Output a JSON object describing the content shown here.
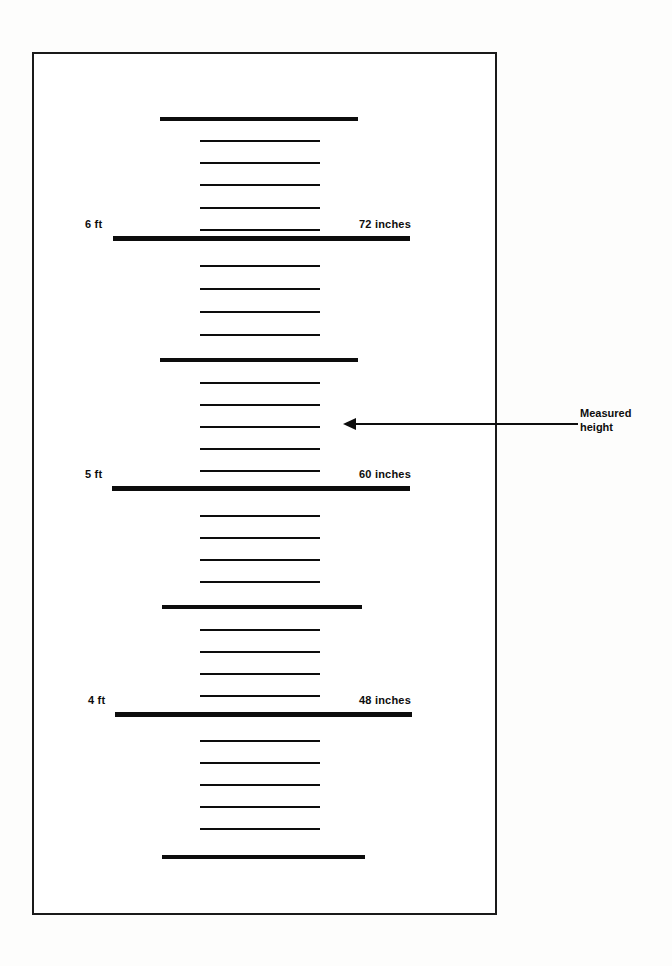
{
  "figure": {
    "background_color": "#fdfdfc",
    "ink_color": "#0d0d0d"
  },
  "chart_data": {
    "type": "table",
    "orientation": "vertical",
    "unit_major": "feet",
    "unit_minor": "inches",
    "axis_range_inches": [
      42,
      78
    ],
    "grid": false,
    "legend": false,
    "labeled_marks": [
      {
        "inches": 72,
        "feet_label": "6 ft",
        "inches_label": "72 inches"
      },
      {
        "inches": 60,
        "feet_label": "5 ft",
        "inches_label": "60 inches"
      },
      {
        "inches": 48,
        "feet_label": "4 ft",
        "inches_label": "48 inches"
      }
    ],
    "annotation": {
      "caption_line_1": "Measured",
      "caption_line_2": "height",
      "points_to_inches": 64
    },
    "ticks": [
      {
        "inches": 78,
        "kind": "medium",
        "y": 117,
        "x1": 160,
        "x2": 358
      },
      {
        "inches": 77,
        "kind": "minor",
        "y": 140,
        "x1": 200,
        "x2": 320
      },
      {
        "inches": 76,
        "kind": "minor",
        "y": 162,
        "x1": 200,
        "x2": 320
      },
      {
        "inches": 75,
        "kind": "minor",
        "y": 184,
        "x1": 200,
        "x2": 320
      },
      {
        "inches": 74,
        "kind": "minor",
        "y": 207,
        "x1": 200,
        "x2": 320
      },
      {
        "inches": 73,
        "kind": "minor",
        "y": 229,
        "x1": 200,
        "x2": 320
      },
      {
        "inches": 72,
        "kind": "major",
        "y": 236,
        "x1": 113,
        "x2": 410
      },
      {
        "inches": 71,
        "kind": "minor",
        "y": 265,
        "x1": 200,
        "x2": 320
      },
      {
        "inches": 70,
        "kind": "minor",
        "y": 288,
        "x1": 200,
        "x2": 320
      },
      {
        "inches": 69,
        "kind": "minor",
        "y": 311,
        "x1": 200,
        "x2": 320
      },
      {
        "inches": 68,
        "kind": "minor",
        "y": 334,
        "x1": 200,
        "x2": 320
      },
      {
        "inches": 66,
        "kind": "medium",
        "y": 358,
        "x1": 160,
        "x2": 358
      },
      {
        "inches": 65,
        "kind": "minor",
        "y": 382,
        "x1": 200,
        "x2": 320
      },
      {
        "inches": 64,
        "kind": "minor",
        "y": 404,
        "x1": 200,
        "x2": 320
      },
      {
        "inches": 63,
        "kind": "minor",
        "y": 426,
        "x1": 200,
        "x2": 320
      },
      {
        "inches": 62,
        "kind": "minor",
        "y": 448,
        "x1": 200,
        "x2": 320
      },
      {
        "inches": 61,
        "kind": "minor",
        "y": 470,
        "x1": 200,
        "x2": 320
      },
      {
        "inches": 60,
        "kind": "major",
        "y": 486,
        "x1": 112,
        "x2": 410
      },
      {
        "inches": 59,
        "kind": "minor",
        "y": 515,
        "x1": 200,
        "x2": 320
      },
      {
        "inches": 58,
        "kind": "minor",
        "y": 537,
        "x1": 200,
        "x2": 320
      },
      {
        "inches": 57,
        "kind": "minor",
        "y": 559,
        "x1": 200,
        "x2": 320
      },
      {
        "inches": 56,
        "kind": "minor",
        "y": 581,
        "x1": 200,
        "x2": 320
      },
      {
        "inches": 54,
        "kind": "medium",
        "y": 605,
        "x1": 162,
        "x2": 362
      },
      {
        "inches": 53,
        "kind": "minor",
        "y": 629,
        "x1": 200,
        "x2": 320
      },
      {
        "inches": 52,
        "kind": "minor",
        "y": 651,
        "x1": 200,
        "x2": 320
      },
      {
        "inches": 51,
        "kind": "minor",
        "y": 673,
        "x1": 200,
        "x2": 320
      },
      {
        "inches": 50,
        "kind": "minor",
        "y": 695,
        "x1": 200,
        "x2": 320
      },
      {
        "inches": 48,
        "kind": "major",
        "y": 712,
        "x1": 115,
        "x2": 412
      },
      {
        "inches": 47,
        "kind": "minor",
        "y": 740,
        "x1": 200,
        "x2": 320
      },
      {
        "inches": 46,
        "kind": "minor",
        "y": 762,
        "x1": 200,
        "x2": 320
      },
      {
        "inches": 45,
        "kind": "minor",
        "y": 784,
        "x1": 200,
        "x2": 320
      },
      {
        "inches": 44,
        "kind": "minor",
        "y": 806,
        "x1": 200,
        "x2": 320
      },
      {
        "inches": 43,
        "kind": "minor",
        "y": 828,
        "x1": 200,
        "x2": 320
      },
      {
        "inches": 42,
        "kind": "medium",
        "y": 855,
        "x1": 162,
        "x2": 365
      }
    ]
  },
  "labels": {
    "ft6": {
      "text": "6 ft",
      "x": 85,
      "y": 218
    },
    "in72": {
      "text": "72 inches",
      "x": 411,
      "y": 218
    },
    "ft5": {
      "text": "5 ft",
      "x": 85,
      "y": 468
    },
    "in60": {
      "text": "60 inches",
      "x": 411,
      "y": 468
    },
    "ft4": {
      "text": "4 ft",
      "x": 88,
      "y": 694
    },
    "in48": {
      "text": "48 inches",
      "x": 411,
      "y": 694
    }
  },
  "annotation": {
    "caption_line_1": "Measured",
    "caption_line_2": "height",
    "arrow": {
      "x_start": 578,
      "x_end": 343,
      "y": 423
    },
    "caption_pos": {
      "x": 580,
      "y": 406
    }
  }
}
